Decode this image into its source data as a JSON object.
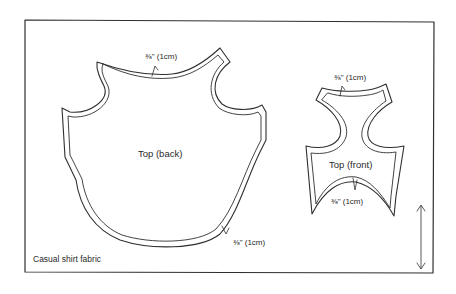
{
  "diagram": {
    "type": "sewing-pattern-layout",
    "fabric_label": "Casual shirt fabric",
    "grainline": "vertical double-headed arrow",
    "pieces": [
      {
        "name": "Top (back)",
        "seam_allowances": [
          {
            "label": "⅜\" (1cm)",
            "position": "neckline"
          },
          {
            "label": "⅜\" (1cm)",
            "position": "hem"
          }
        ]
      },
      {
        "name": "Top (front)",
        "seam_allowances": [
          {
            "label": "⅜\" (1cm)",
            "position": "neckline"
          },
          {
            "label": "⅜\" (1cm)",
            "position": "hem"
          }
        ]
      }
    ]
  },
  "colors": {
    "ink": "#2f2f2f",
    "background": "#ffffff"
  }
}
